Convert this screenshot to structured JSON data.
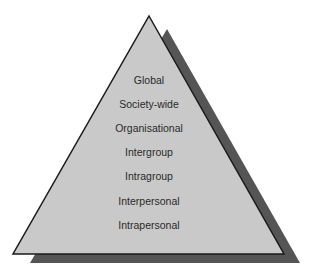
{
  "diagram": {
    "type": "pyramid",
    "colors": {
      "fill": "#c9c9c9",
      "shadow": "#555555",
      "outline": "#1a1a1a",
      "text": "#2a2a2a"
    },
    "levels": [
      {
        "label": "Global"
      },
      {
        "label": "Society-wide"
      },
      {
        "label": "Organisational"
      },
      {
        "label": "Intergroup"
      },
      {
        "label": "Intragroup"
      },
      {
        "label": "Interpersonal"
      },
      {
        "label": "Intrapersonal"
      }
    ]
  }
}
